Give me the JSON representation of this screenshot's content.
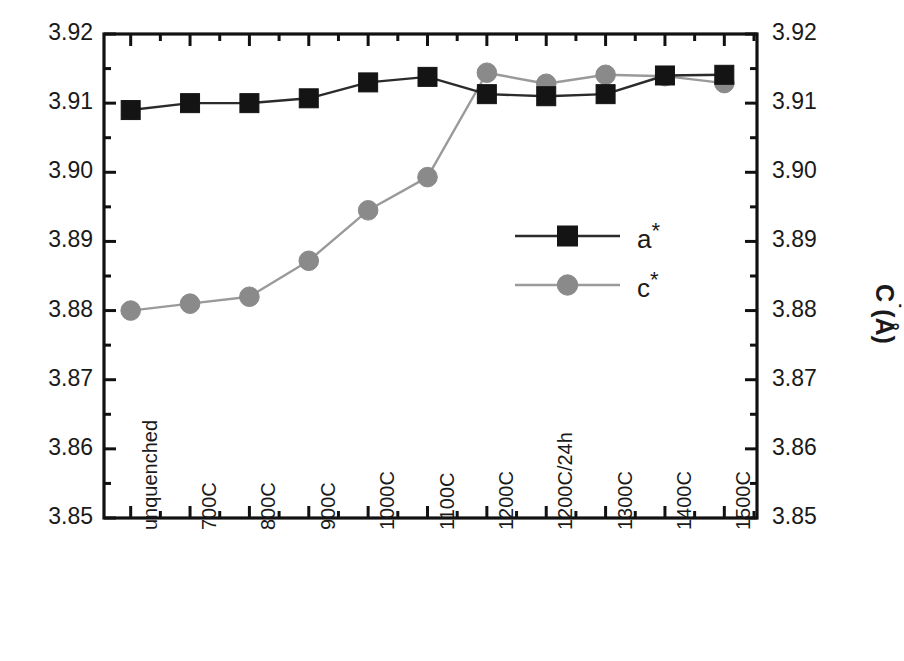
{
  "chart_data": {
    "type": "line",
    "title": "",
    "xlabel": "",
    "ylabel": "a*(Å)",
    "y2label": "C˙(Å)",
    "categories": [
      "unquenched",
      "700C",
      "800C",
      "900C",
      "1000C",
      "1100C",
      "1200C",
      "1200C/24h",
      "1300C",
      "1400C",
      "1500C"
    ],
    "ylim": [
      3.85,
      3.92
    ],
    "y2lim": [
      3.85,
      3.92
    ],
    "yticks": [
      "3.85",
      "3.86",
      "3.87",
      "3.88",
      "3.89",
      "3.90",
      "3.91",
      "3.92"
    ],
    "ytick_values": [
      3.85,
      3.86,
      3.87,
      3.88,
      3.89,
      3.9,
      3.91,
      3.92
    ],
    "y2ticks": [
      "3.85",
      "3.86",
      "3.87",
      "3.88",
      "3.89",
      "3.90",
      "3.91",
      "3.92"
    ],
    "minor_ticks_per_interval": 1,
    "grid": false,
    "legend_position": "center-right",
    "series": [
      {
        "name": "a*",
        "marker": "square",
        "color": "#141414",
        "line_color": "#2b2b2b",
        "values": [
          3.909,
          3.91,
          3.91,
          3.9107,
          3.913,
          3.9138,
          3.9113,
          3.911,
          3.9113,
          3.914,
          3.9141
        ]
      },
      {
        "name": "c*",
        "marker": "circle",
        "color": "#8a8a8a",
        "line_color": "#9a9a9a",
        "values": [
          3.88,
          3.881,
          3.882,
          3.8872,
          3.8945,
          3.8993,
          3.9144,
          3.9128,
          3.9141,
          3.9139,
          3.9129
        ]
      }
    ]
  },
  "legend": {
    "items": [
      {
        "label": "a*",
        "base": "a",
        "star": "*"
      },
      {
        "label": "c*",
        "base": "c",
        "star": "*"
      }
    ]
  },
  "axes": {
    "left_label_base": "a",
    "left_label_rest": "(Å)",
    "right_label_base": "C",
    "right_label_rest": "(Å)"
  }
}
